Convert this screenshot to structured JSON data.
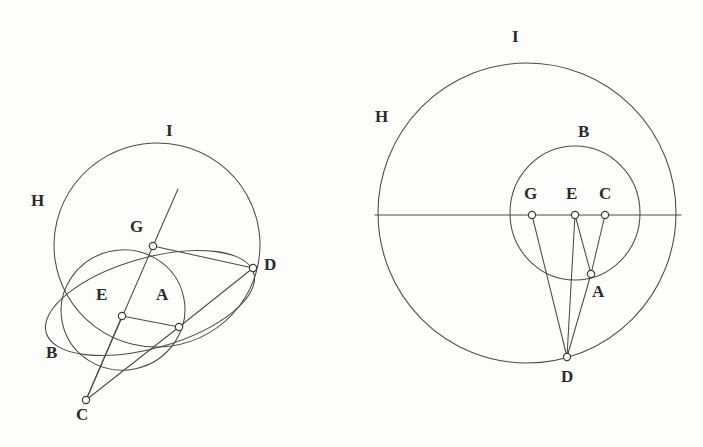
{
  "figure": {
    "background_color": "#fdfdfc",
    "stroke_color": "#4a4a4a",
    "node_fill_color": "#ffffff",
    "label_color": "#2b2b2b",
    "panels": [
      {
        "id": "left-panel",
        "name": "oblique-view",
        "labels": [
          {
            "key": "I",
            "text": "I",
            "x": 166,
            "y": 122
          },
          {
            "key": "H",
            "text": "H",
            "x": 31,
            "y": 192
          },
          {
            "key": "G",
            "text": "G",
            "x": 130,
            "y": 218
          },
          {
            "key": "D",
            "text": "D",
            "x": 264,
            "y": 256
          },
          {
            "key": "E",
            "text": "E",
            "x": 96,
            "y": 286
          },
          {
            "key": "A",
            "text": "A",
            "x": 156,
            "y": 286
          },
          {
            "key": "B",
            "text": "B",
            "x": 46,
            "y": 344
          },
          {
            "key": "C",
            "text": "C",
            "x": 76,
            "y": 406
          }
        ],
        "points": [
          {
            "key": "G",
            "x": 153,
            "y": 246
          },
          {
            "key": "D",
            "x": 253,
            "y": 268
          },
          {
            "key": "E",
            "x": 122,
            "y": 316
          },
          {
            "key": "A",
            "x": 179,
            "y": 327
          },
          {
            "key": "C",
            "x": 86,
            "y": 400
          }
        ],
        "circles": [
          {
            "key": "outer-circle-HI",
            "cx": 157,
            "cy": 245,
            "rx": 103,
            "ry": 102,
            "rotate": -8
          },
          {
            "key": "inner-circle-B",
            "cx": 123,
            "cy": 310,
            "rx": 62,
            "ry": 60,
            "rotate": -12
          },
          {
            "key": "oblique-ellipse-AD",
            "cx": 150,
            "cy": 303,
            "rx": 108,
            "ry": 45,
            "rotate": -16
          }
        ],
        "segments": [
          {
            "key": "G-D",
            "x1": 153,
            "y1": 246,
            "x2": 253,
            "y2": 268
          },
          {
            "key": "G-axis-up",
            "x1": 153,
            "y1": 246,
            "x2": 178,
            "y2": 189
          },
          {
            "key": "G-C-axis",
            "x1": 153,
            "y1": 246,
            "x2": 86,
            "y2": 400
          },
          {
            "key": "E-A",
            "x1": 122,
            "y1": 316,
            "x2": 179,
            "y2": 327
          },
          {
            "key": "E-C",
            "x1": 122,
            "y1": 316,
            "x2": 86,
            "y2": 400
          },
          {
            "key": "A-C",
            "x1": 179,
            "y1": 327,
            "x2": 86,
            "y2": 400
          },
          {
            "key": "A-D",
            "x1": 179,
            "y1": 327,
            "x2": 253,
            "y2": 268
          }
        ]
      },
      {
        "id": "right-panel",
        "name": "front-view",
        "labels": [
          {
            "key": "I",
            "text": "I",
            "x": 512,
            "y": 28
          },
          {
            "key": "H",
            "text": "H",
            "x": 375,
            "y": 108
          },
          {
            "key": "B",
            "text": "B",
            "x": 578,
            "y": 123
          },
          {
            "key": "G",
            "text": "G",
            "x": 524,
            "y": 185
          },
          {
            "key": "E",
            "text": "E",
            "x": 566,
            "y": 185
          },
          {
            "key": "C",
            "text": "C",
            "x": 599,
            "y": 185
          },
          {
            "key": "A",
            "text": "A",
            "x": 592,
            "y": 283
          },
          {
            "key": "D",
            "text": "D",
            "x": 561,
            "y": 368
          }
        ],
        "points": [
          {
            "key": "G",
            "x": 532,
            "y": 215
          },
          {
            "key": "E",
            "x": 575,
            "y": 215
          },
          {
            "key": "C",
            "x": 605,
            "y": 215
          },
          {
            "key": "A",
            "x": 591,
            "y": 274
          },
          {
            "key": "D",
            "x": 567,
            "y": 357
          }
        ],
        "circles": [
          {
            "key": "outer-circle-HI",
            "cx": 527,
            "cy": 213,
            "rx": 149,
            "ry": 150,
            "rotate": 0
          },
          {
            "key": "inner-circle-B",
            "cx": 575,
            "cy": 213,
            "rx": 65,
            "ry": 67,
            "rotate": 0
          }
        ],
        "segments": [
          {
            "key": "diameter-horizontal",
            "x1": 375,
            "y1": 215,
            "x2": 681,
            "y2": 215
          },
          {
            "key": "G-D",
            "x1": 532,
            "y1": 215,
            "x2": 567,
            "y2": 357
          },
          {
            "key": "E-D",
            "x1": 575,
            "y1": 215,
            "x2": 567,
            "y2": 357
          },
          {
            "key": "C-A",
            "x1": 605,
            "y1": 215,
            "x2": 591,
            "y2": 274
          },
          {
            "key": "A-D",
            "x1": 591,
            "y1": 274,
            "x2": 567,
            "y2": 357
          },
          {
            "key": "E-A",
            "x1": 575,
            "y1": 215,
            "x2": 591,
            "y2": 274
          }
        ]
      }
    ]
  }
}
